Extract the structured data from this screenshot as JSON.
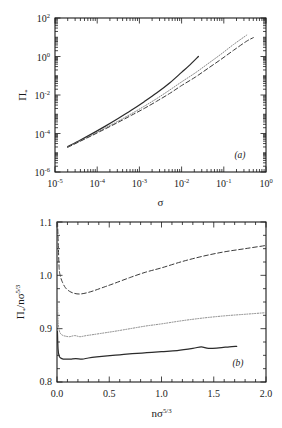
{
  "figure": {
    "title": "",
    "panels": [
      {
        "tag": "(a)",
        "xlabel": "σ",
        "ylabel": "Π*",
        "ylabel_base": "Π",
        "ylabel_sub": "*",
        "xticklabels": [
          "10-5",
          "10-4",
          "10-3",
          "10-2",
          "10-1",
          "100"
        ],
        "yticklabels": [
          "102",
          "100",
          "10-2",
          "10-4",
          "10-6"
        ]
      },
      {
        "tag": "(b)",
        "xlabel": "nσ5/3",
        "ylabel": "Π*/nσ5/3",
        "xticklabels": [
          "0.0",
          "0.5",
          "1.0",
          "1.5",
          "2.0"
        ],
        "yticklabels": [
          "0.8",
          "0.9",
          "1.0",
          "1.1"
        ]
      }
    ]
  },
  "chart_data": [
    {
      "type": "line",
      "panel": "(a)",
      "title": "",
      "xlabel": "sigma",
      "ylabel": "Pi_*",
      "xscale": "log",
      "yscale": "log",
      "xlim": [
        1e-05,
        1.0
      ],
      "ylim": [
        1e-06,
        100
      ],
      "xticks": [
        1e-05,
        0.0001,
        0.001,
        0.01,
        0.1,
        1
      ],
      "yticks": [
        1e-06,
        0.0001,
        0.01,
        1,
        100
      ],
      "grid": false,
      "legend": "none",
      "series": [
        {
          "name": "solid",
          "style": "solid",
          "x": [
            2e-05,
            4e-05,
            8e-05,
            0.00016,
            0.00032,
            0.00064,
            0.0013,
            0.0026,
            0.0052,
            0.01,
            0.016,
            0.025
          ],
          "y": [
            2.1e-05,
            4.6e-05,
            0.000105,
            0.00025,
            0.00062,
            0.0016,
            0.0045,
            0.013,
            0.042,
            0.15,
            0.38,
            1.0
          ]
        },
        {
          "name": "dotted",
          "style": "dotted",
          "x": [
            2e-05,
            4e-05,
            8e-05,
            0.00016,
            0.00032,
            0.00064,
            0.0013,
            0.0026,
            0.0052,
            0.01,
            0.021,
            0.042,
            0.085,
            0.17,
            0.35
          ],
          "y": [
            2e-05,
            4.2e-05,
            9e-05,
            0.0002,
            0.00045,
            0.00105,
            0.0026,
            0.0066,
            0.018,
            0.048,
            0.14,
            0.42,
            1.3,
            4.2,
            13.0
          ]
        },
        {
          "name": "dashed",
          "style": "dashed",
          "x": [
            2e-05,
            4e-05,
            8e-05,
            0.00016,
            0.00032,
            0.00064,
            0.0013,
            0.0026,
            0.0052,
            0.01,
            0.021,
            0.042,
            0.085,
            0.17,
            0.35,
            0.5
          ],
          "y": [
            1.9e-05,
            4e-05,
            8.4e-05,
            0.00018,
            0.00039,
            0.00087,
            0.002,
            0.0048,
            0.012,
            0.031,
            0.084,
            0.24,
            0.7,
            2.1,
            6.3,
            9.5
          ]
        }
      ]
    },
    {
      "type": "line",
      "panel": "(b)",
      "title": "",
      "xlabel": "n sigma^(5/3)",
      "ylabel": "Pi_* / (n sigma^(5/3))",
      "xscale": "linear",
      "yscale": "linear",
      "xlim": [
        0.0,
        2.0
      ],
      "ylim": [
        0.8,
        1.1
      ],
      "xticks": [
        0.0,
        0.5,
        1.0,
        1.5,
        2.0
      ],
      "yticks": [
        0.8,
        0.9,
        1.0,
        1.1
      ],
      "grid": false,
      "legend": "none",
      "series": [
        {
          "name": "dashed",
          "style": "dashed",
          "x": [
            0.005,
            0.012,
            0.02,
            0.03,
            0.05,
            0.08,
            0.12,
            0.17,
            0.22,
            0.28,
            0.35,
            0.45,
            0.55,
            0.7,
            0.85,
            1.0,
            1.2,
            1.4,
            1.6,
            1.8,
            2.0
          ],
          "y": [
            1.1,
            1.06,
            1.015,
            1.0,
            0.988,
            0.977,
            0.97,
            0.966,
            0.965,
            0.967,
            0.971,
            0.978,
            0.985,
            0.996,
            1.006,
            1.014,
            1.026,
            1.036,
            1.044,
            1.05,
            1.056
          ]
        },
        {
          "name": "dotted",
          "style": "dotted",
          "x": [
            0.004,
            0.01,
            0.018,
            0.03,
            0.05,
            0.08,
            0.12,
            0.17,
            0.22,
            0.28,
            0.35,
            0.45,
            0.55,
            0.7,
            0.85,
            1.0,
            1.2,
            1.4,
            1.6,
            1.8,
            2.0
          ],
          "y": [
            0.955,
            0.916,
            0.9,
            0.892,
            0.888,
            0.886,
            0.885,
            0.887,
            0.885,
            0.887,
            0.889,
            0.892,
            0.895,
            0.9,
            0.905,
            0.909,
            0.915,
            0.92,
            0.924,
            0.927,
            0.93
          ]
        },
        {
          "name": "solid",
          "style": "solid",
          "x": [
            0.004,
            0.01,
            0.02,
            0.035,
            0.06,
            0.09,
            0.13,
            0.18,
            0.24,
            0.3,
            0.38,
            0.48,
            0.6,
            0.72,
            0.86,
            1.0,
            1.15,
            1.3,
            1.38,
            1.45,
            1.55,
            1.65,
            1.72
          ],
          "y": [
            0.895,
            0.862,
            0.849,
            0.845,
            0.843,
            0.843,
            0.843,
            0.844,
            0.843,
            0.845,
            0.847,
            0.849,
            0.851,
            0.853,
            0.855,
            0.857,
            0.859,
            0.863,
            0.866,
            0.863,
            0.864,
            0.866,
            0.867
          ]
        }
      ]
    }
  ],
  "colors": {
    "ink": "#1a1a1a",
    "background": "#ffffff",
    "solid": "#2b2b2b",
    "dotted": "#7a7a7a",
    "dashed": "#3a3a3a"
  }
}
